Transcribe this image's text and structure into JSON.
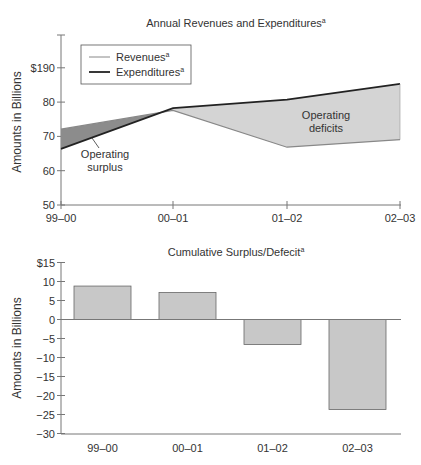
{
  "chart_data": [
    {
      "type": "area",
      "title": "Annual Revenues and Expenditures",
      "title_footnote": "a",
      "xlabel": "",
      "ylabel": "Amounts in Billions",
      "categories": [
        "99–00",
        "00–01",
        "01–02",
        "02–03"
      ],
      "yticks": [
        "50",
        "60",
        "70",
        "80",
        "$190"
      ],
      "ylim": [
        50,
        100
      ],
      "grid": false,
      "legend_position": "upper-left",
      "series": [
        {
          "name": "Revenues",
          "footnote": "a",
          "values": [
            72.3,
            77.8,
            67.0,
            69.2
          ],
          "color": "#888888"
        },
        {
          "name": "Expenditures",
          "footnote": "a",
          "values": [
            66.5,
            78.5,
            81.0,
            85.6
          ],
          "color": "#222222"
        }
      ],
      "annotations": [
        {
          "text_lines": [
            "Operating",
            "surplus"
          ],
          "fill": "#8c8c8c"
        },
        {
          "text_lines": [
            "Operating",
            "deficits"
          ],
          "fill": "#d4d4d4"
        }
      ]
    },
    {
      "type": "bar",
      "title": "Cumulative Surplus/Defecit",
      "title_footnote": "a",
      "xlabel": "",
      "ylabel": "Amounts in Billions",
      "categories": [
        "99–00",
        "00–01",
        "01–02",
        "02–03"
      ],
      "values": [
        8.8,
        7.1,
        -6.6,
        -23.7
      ],
      "yticks": [
        "$15",
        "10",
        "5",
        "0",
        "−5",
        "−10",
        "−15",
        "−20",
        "−25",
        "−30"
      ],
      "ylim": [
        -30,
        15
      ],
      "grid": false,
      "bar_color": "#c8c8c8"
    }
  ]
}
